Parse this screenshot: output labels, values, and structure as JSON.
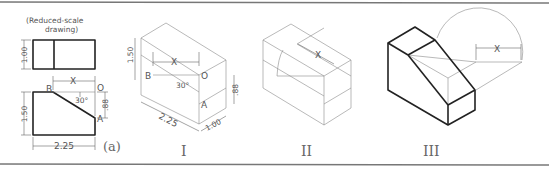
{
  "figure": {
    "note": "(Reduced-scale drawing)",
    "note_line1": "(Reduced-scale",
    "note_line2": "drawing)",
    "part_label": "(a)",
    "orthographic": {
      "top_view_depth": "1.00",
      "front_view_height": "1.50",
      "front_view_width": "2.25",
      "offset_height": ".88",
      "angle": "30°",
      "distance_label": "X",
      "points": {
        "A": "A",
        "B": "B",
        "O": "O"
      }
    },
    "steps": [
      {
        "label": "I",
        "height": "1.50",
        "width": "2.25",
        "depth": "1.00",
        "offset": ".88",
        "angle": "30°",
        "distance": "X",
        "points": [
          "B",
          "O",
          "A"
        ]
      },
      {
        "label": "II",
        "distance": "X"
      },
      {
        "label": "III",
        "distance": "X"
      }
    ]
  }
}
